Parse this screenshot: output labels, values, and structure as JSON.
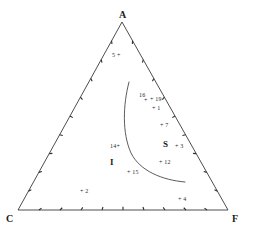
{
  "chart_data": {
    "type": "scatter",
    "title": "",
    "subtitle": "",
    "diagram_kind": "ternary",
    "xlabel": "",
    "ylabel": "",
    "grid": false,
    "legend_position": "none",
    "axis_ranges": {
      "A": [
        0,
        100
      ],
      "C": [
        0,
        100
      ],
      "F": [
        0,
        100
      ]
    },
    "ticks_per_edge": 10,
    "vertices": [
      {
        "name": "A",
        "label": "A",
        "px": 122,
        "py": 22
      },
      {
        "name": "C",
        "label": "C",
        "px": 18,
        "py": 210
      },
      {
        "name": "F",
        "label": "F",
        "px": 228,
        "py": 210
      }
    ],
    "regions": [
      {
        "name": "I",
        "label": "I",
        "px": 110,
        "py": 163
      },
      {
        "name": "S",
        "label": "S",
        "px": 163,
        "py": 145
      }
    ],
    "points": [
      {
        "id": "5",
        "label": "5 +",
        "px": 112,
        "py": 52,
        "anchor": "left"
      },
      {
        "id": "16",
        "label": "16",
        "px": 139,
        "py": 92,
        "anchor": "left"
      },
      {
        "id": "16plus",
        "label": "+",
        "px": 144,
        "py": 97,
        "anchor": "left"
      },
      {
        "id": "19",
        "label": "+ 19",
        "px": 150,
        "py": 96,
        "anchor": "left"
      },
      {
        "id": "1",
        "label": "+ 1",
        "px": 152,
        "py": 105,
        "anchor": "left"
      },
      {
        "id": "7",
        "label": "+ 7",
        "px": 160,
        "py": 122,
        "anchor": "left"
      },
      {
        "id": "3",
        "label": "+ 3",
        "px": 175,
        "py": 143,
        "anchor": "left"
      },
      {
        "id": "14",
        "label": "14+",
        "px": 110,
        "py": 143,
        "anchor": "left"
      },
      {
        "id": "12",
        "label": "+ 12",
        "px": 159,
        "py": 159,
        "anchor": "left"
      },
      {
        "id": "15",
        "label": "+ 15",
        "px": 127,
        "py": 169,
        "anchor": "left"
      },
      {
        "id": "2",
        "label": "+ 2",
        "px": 80,
        "py": 188,
        "anchor": "left"
      },
      {
        "id": "4",
        "label": "+ 4",
        "px": 178,
        "py": 196,
        "anchor": "left"
      }
    ],
    "boundary_curve": {
      "name": "I-S phase boundary",
      "path": "M 129 82 C 123 105, 122 133, 131 153 C 140 171, 162 180, 185 182"
    },
    "colors": {
      "line": "#3a3a3a",
      "curve": "#4a4a4a",
      "text": "#1a1a1a",
      "background": "#ffffff"
    }
  }
}
